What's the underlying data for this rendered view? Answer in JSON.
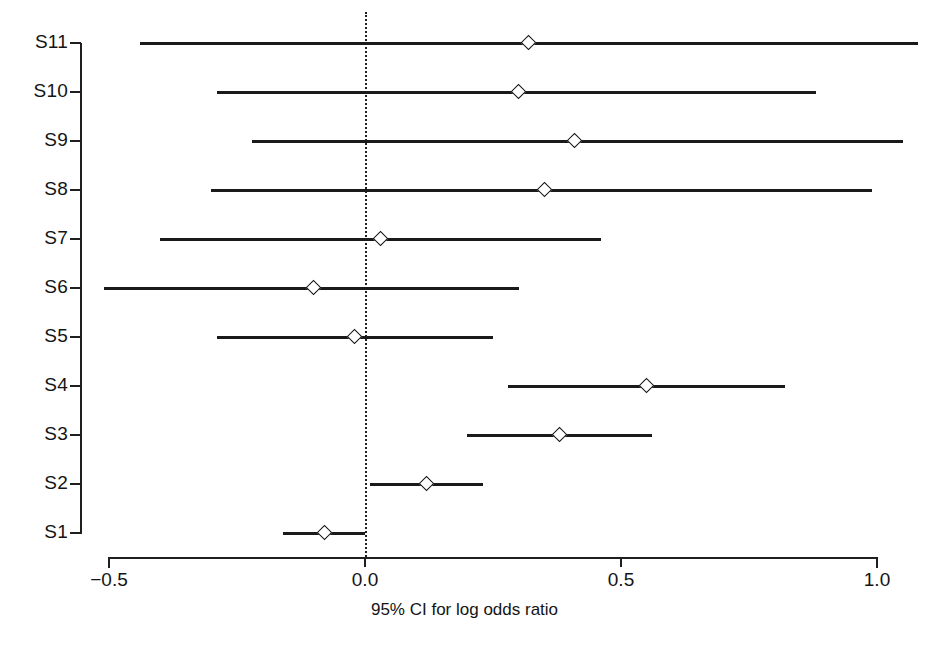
{
  "chart_data": {
    "type": "scatter",
    "title": "",
    "subtitle": "",
    "xlabel": "95% CI for log odds ratio",
    "ylabel": "",
    "xlim": [
      -0.5,
      1.0
    ],
    "xticks": [
      -0.5,
      0.0,
      0.5,
      1.0
    ],
    "xticklabels": [
      "−0.5",
      "0.0",
      "0.5",
      "1.0"
    ],
    "grid": false,
    "legend": null,
    "reference_line": {
      "value": 0.0,
      "style": "dotted",
      "color": "#1f1f1f"
    },
    "marker_style": "open-diamond",
    "categories": [
      "S1",
      "S2",
      "S3",
      "S4",
      "S5",
      "S6",
      "S7",
      "S8",
      "S9",
      "S10",
      "S11"
    ],
    "series": [
      {
        "name": "Log odds ratio with 95% CI",
        "points": [
          {
            "label": "S11",
            "estimate": 0.32,
            "ci_low": -0.44,
            "ci_high": 1.08
          },
          {
            "label": "S10",
            "estimate": 0.3,
            "ci_low": -0.29,
            "ci_high": 0.88
          },
          {
            "label": "S9",
            "estimate": 0.41,
            "ci_low": -0.22,
            "ci_high": 1.05
          },
          {
            "label": "S8",
            "estimate": 0.35,
            "ci_low": -0.3,
            "ci_high": 0.99
          },
          {
            "label": "S7",
            "estimate": 0.03,
            "ci_low": -0.4,
            "ci_high": 0.46
          },
          {
            "label": "S6",
            "estimate": -0.1,
            "ci_low": -0.51,
            "ci_high": 0.3
          },
          {
            "label": "S5",
            "estimate": -0.02,
            "ci_low": -0.29,
            "ci_high": 0.25
          },
          {
            "label": "S4",
            "estimate": 0.55,
            "ci_low": 0.28,
            "ci_high": 0.82
          },
          {
            "label": "S3",
            "estimate": 0.38,
            "ci_low": 0.2,
            "ci_high": 0.56
          },
          {
            "label": "S2",
            "estimate": 0.12,
            "ci_low": 0.01,
            "ci_high": 0.23
          },
          {
            "label": "S1",
            "estimate": -0.08,
            "ci_low": -0.16,
            "ci_high": 0.0
          }
        ]
      }
    ]
  },
  "axis": {
    "x_title": "95% CI for log odds ratio",
    "tick_labels": [
      "−0.5",
      "0.0",
      "0.5",
      "1.0"
    ]
  }
}
